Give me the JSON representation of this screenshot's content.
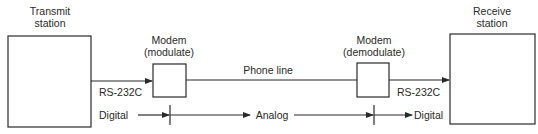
{
  "diagram": {
    "nodes": {
      "transmit": {
        "label_line1": "Transmit",
        "label_line2": "station"
      },
      "modem_tx": {
        "label_line1": "Modem",
        "label_line2": "(modulate)"
      },
      "modem_rx": {
        "label_line1": "Modem",
        "label_line2": "(demodulate)"
      },
      "receive": {
        "label_line1": "Receive",
        "label_line2": "station"
      }
    },
    "links": {
      "left_interface": "RS-232C",
      "middle": "Phone line",
      "right_interface": "RS-232C"
    },
    "signal_types": {
      "left": "Digital",
      "middle": "Analog",
      "right": "Digital"
    },
    "colors": {
      "stroke": "#2a2a2a",
      "background": "#ffffff"
    }
  }
}
